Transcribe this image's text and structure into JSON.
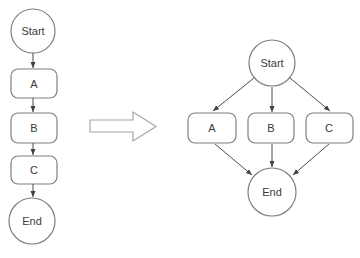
{
  "diagram": {
    "colors": {
      "background": "#ffffff",
      "shape_fill": "#ffffff",
      "shape_stroke": "#7f7f7f",
      "connector": "#4d4d4d",
      "arrowhead": "#404040",
      "block_arrow_stroke": "#a6a6a6",
      "text": "#3b3b3b"
    },
    "left_flow": {
      "start": "Start",
      "steps": [
        "A",
        "B",
        "C"
      ],
      "end": "End"
    },
    "transform_arrow": {
      "direction": "right"
    },
    "right_flow": {
      "start": "Start",
      "branches": [
        "A",
        "B",
        "C"
      ],
      "end": "End"
    }
  }
}
